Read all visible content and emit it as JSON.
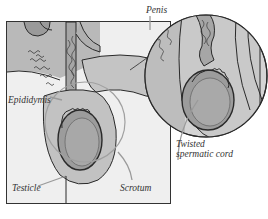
{
  "figure": {
    "labels": {
      "penis": "Penis",
      "epididymis": "Epididymis",
      "testicle": "Testicle",
      "scrotum": "Scrotum",
      "twisted_cord_line1": "Twisted",
      "twisted_cord_line2": "spermatic cord"
    },
    "colors": {
      "frame_bg": "#efefef",
      "tissue_light": "#c8c8c8",
      "tissue_mid": "#a9a9a9",
      "tissue_dark": "#8c8c8c",
      "outline": "#2a2a2a",
      "pointer": "#9a9a9a",
      "inset_ring": "#a0a0a0"
    }
  }
}
